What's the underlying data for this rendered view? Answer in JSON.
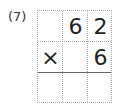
{
  "problem": {
    "label": "(7)",
    "rows": [
      [
        "",
        "6",
        "2"
      ],
      [
        "×",
        "",
        "6"
      ],
      [
        "",
        "",
        ""
      ]
    ]
  }
}
